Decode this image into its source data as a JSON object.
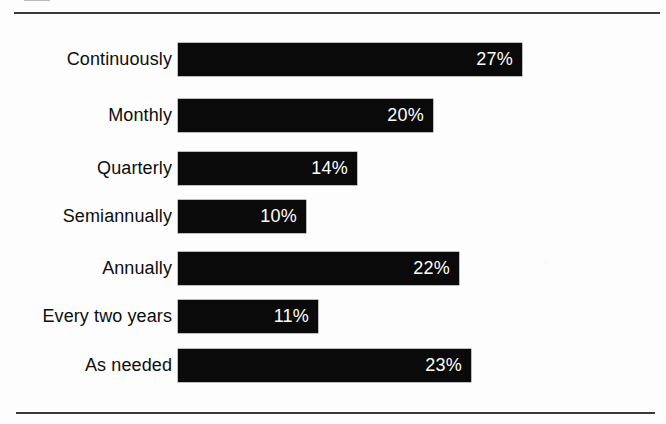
{
  "figure": {
    "background_color": "#fdfdfd",
    "rule_color": "#3a3a3a",
    "bar_color": "#0a0a0a",
    "label_color": "#0d0d0d",
    "value_color": "#ffffff",
    "top_rule_name": "top-divider",
    "bottom_rule_name": "bottom-divider"
  },
  "chart_data": {
    "type": "bar",
    "orientation": "horizontal",
    "title": "",
    "subtitle": "",
    "xlabel": "",
    "ylabel": "",
    "grid": false,
    "legend": false,
    "legend_position": "none",
    "value_suffix": "%",
    "xlim": [
      0,
      30
    ],
    "categories": [
      "Continuously",
      "Monthly",
      "Quarterly",
      "Semiannually",
      "Annually",
      "Every two years",
      "As needed"
    ],
    "values": [
      27,
      20,
      14,
      10,
      22,
      11,
      23
    ],
    "value_labels": [
      "27%",
      "20%",
      "14%",
      "10%",
      "22%",
      "11%",
      "23%"
    ],
    "bars": [
      {
        "label": "Continuously",
        "value": 27,
        "value_label": "27%"
      },
      {
        "label": "Monthly",
        "value": 20,
        "value_label": "20%"
      },
      {
        "label": "Quarterly",
        "value": 14,
        "value_label": "14%"
      },
      {
        "label": "Semiannually",
        "value": 10,
        "value_label": "10%"
      },
      {
        "label": "Annually",
        "value": 22,
        "value_label": "22%"
      },
      {
        "label": "Every two years",
        "value": 11,
        "value_label": "11%"
      },
      {
        "label": "As needed",
        "value": 23,
        "value_label": "23%"
      }
    ]
  },
  "layout": {
    "bar_origin_x": 178,
    "px_per_percent": 12.75,
    "bar_height": 33,
    "row_tops": [
      43,
      99,
      152,
      200,
      252,
      300,
      349
    ]
  }
}
